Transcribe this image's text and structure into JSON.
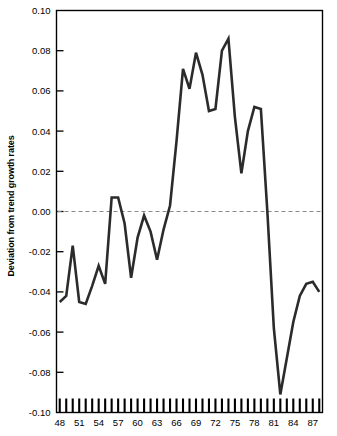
{
  "chart_data": {
    "type": "line",
    "title": "",
    "xlabel": "",
    "ylabel": "Deviation from trend growth rates",
    "xlim": [
      1947.5,
      1988.5
    ],
    "ylim": [
      -0.1,
      0.1
    ],
    "grid": false,
    "legend": null,
    "zero_reference_line": 0.0,
    "line_color": "#2b2b2b",
    "axis_color": "#000000",
    "zero_line_color": "#8a8a8a",
    "x_tick_labels": [
      "48",
      "51",
      "54",
      "57",
      "60",
      "63",
      "66",
      "69",
      "72",
      "75",
      "78",
      "81",
      "84",
      "87"
    ],
    "x_tick_label_values": [
      1948,
      1951,
      1954,
      1957,
      1960,
      1963,
      1966,
      1969,
      1972,
      1975,
      1978,
      1981,
      1984,
      1987
    ],
    "x_minor_ticks_every": 1,
    "y_tick_labels": [
      "0.10",
      "0.08",
      "0.06",
      "0.04",
      "0.02",
      "0.00",
      "-0.02",
      "-0.04",
      "-0.06",
      "-0.08",
      "-0.10"
    ],
    "y_tick_values": [
      0.1,
      0.08,
      0.06,
      0.04,
      0.02,
      0.0,
      -0.02,
      -0.04,
      -0.06,
      -0.08,
      -0.1
    ],
    "series": [
      {
        "name": "Deviation from trend growth rates",
        "x": [
          1948,
          1949,
          1950,
          1951,
          1952,
          1953,
          1954,
          1955,
          1956,
          1957,
          1958,
          1959,
          1960,
          1961,
          1962,
          1963,
          1964,
          1965,
          1966,
          1967,
          1968,
          1969,
          1970,
          1971,
          1972,
          1973,
          1974,
          1975,
          1976,
          1977,
          1978,
          1979,
          1980,
          1981,
          1982,
          1983,
          1984,
          1985,
          1986,
          1987,
          1988
        ],
        "values": [
          -0.045,
          -0.042,
          -0.017,
          -0.045,
          -0.046,
          -0.037,
          -0.027,
          -0.036,
          0.007,
          0.007,
          -0.006,
          -0.033,
          -0.013,
          -0.002,
          -0.01,
          -0.024,
          -0.009,
          0.003,
          0.035,
          0.071,
          0.061,
          0.079,
          0.068,
          0.05,
          0.051,
          0.08,
          0.086,
          0.047,
          0.019,
          0.04,
          0.052,
          0.051,
          0.0,
          -0.058,
          -0.091,
          -0.073,
          -0.055,
          -0.042,
          -0.036,
          -0.035,
          -0.04
        ]
      }
    ]
  }
}
